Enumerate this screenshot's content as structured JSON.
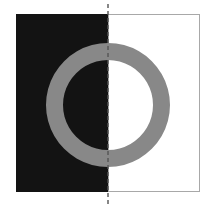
{
  "figure": {
    "canvas": {
      "width": 211,
      "height": 212,
      "background_color": "#ffffff"
    },
    "colors": {
      "black_panel": "#131313",
      "white_panel": "#ffffff",
      "panel_border": "#a8a8a8",
      "ring": "#888888",
      "axis_line": "#555555"
    },
    "shapes": {
      "left_panel": {
        "name": "black-rectangle",
        "x": 16,
        "y": 14,
        "width": 92,
        "height": 178,
        "fill": "#131313"
      },
      "right_panel": {
        "name": "white-rectangle",
        "x": 108,
        "y": 14,
        "width": 92,
        "height": 178,
        "fill": "#ffffff",
        "stroke": "#a8a8a8",
        "stroke_width": 1
      },
      "ring": {
        "name": "gray-annulus",
        "center_x": 108,
        "center_y": 105,
        "outer_radius": 62,
        "inner_radius": 45,
        "fill": "#888888"
      },
      "axis": {
        "name": "vertical-symmetry-axis",
        "x": 108,
        "y_start": 4,
        "y_end": 207,
        "stroke": "#555555",
        "stroke_width": 1.4,
        "dash_pattern": "4 3"
      }
    }
  }
}
